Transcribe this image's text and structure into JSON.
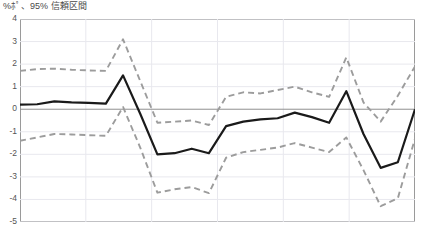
{
  "chart_title": "%ﾎﾟ、95% 信頼区間",
  "axis": {
    "y_ticks": [
      4,
      3,
      2,
      1,
      0,
      -1,
      -2,
      -3,
      -4,
      -5
    ],
    "y_tick_labels": [
      "4",
      "3",
      "2",
      "1",
      "0",
      "-1",
      "-2",
      "-3",
      "-4",
      "-5"
    ],
    "ylim_top": 4,
    "ylim_bottom": -5
  },
  "style": {
    "estimate_color": "#1a1a1a",
    "ci_color": "#9c9c9c",
    "zero_line_color": "#8f8f8f",
    "grid_color": "#e8e8ee",
    "frame_color": "#9a9a9a"
  },
  "chart_data": {
    "type": "line",
    "title": "%ﾎﾟ、95% 信頼区間",
    "xlabel": "",
    "ylabel": "",
    "ylim": [
      -5,
      4
    ],
    "grid": true,
    "grid_vertical_count": 6,
    "legend": "none",
    "zero_reference_line": 0,
    "x": [
      0,
      1,
      2,
      3,
      4,
      5,
      6,
      7,
      8,
      9,
      10,
      11,
      12,
      13,
      14,
      15,
      16,
      17,
      18,
      19,
      20,
      21,
      22,
      23
    ],
    "series": [
      {
        "name": "point-estimate",
        "style": "solid",
        "color": "#1a1a1a",
        "values": [
          0.2,
          0.22,
          0.35,
          0.3,
          0.28,
          0.25,
          1.5,
          -0.2,
          -2.0,
          -1.95,
          -1.75,
          -1.95,
          -0.75,
          -0.55,
          -0.45,
          -0.4,
          -0.15,
          -0.35,
          -0.6,
          0.8,
          -1.1,
          -2.6,
          -2.35,
          0.0
        ]
      },
      {
        "name": "ci-upper-95",
        "style": "dashed",
        "color": "#9c9c9c",
        "values": [
          1.7,
          1.78,
          1.8,
          1.75,
          1.72,
          1.7,
          3.1,
          1.25,
          -0.6,
          -0.55,
          -0.5,
          -0.7,
          0.55,
          0.75,
          0.7,
          0.85,
          1.0,
          0.75,
          0.55,
          2.3,
          0.3,
          -0.55,
          0.6,
          1.9
        ]
      },
      {
        "name": "ci-lower-95",
        "style": "dashed",
        "color": "#9c9c9c",
        "values": [
          -1.4,
          -1.25,
          -1.1,
          -1.12,
          -1.15,
          -1.18,
          0.1,
          -1.7,
          -3.7,
          -3.55,
          -3.45,
          -3.72,
          -2.15,
          -1.9,
          -1.8,
          -1.7,
          -1.5,
          -1.7,
          -1.9,
          -1.25,
          -2.7,
          -4.3,
          -3.95,
          -1.3
        ]
      }
    ]
  }
}
